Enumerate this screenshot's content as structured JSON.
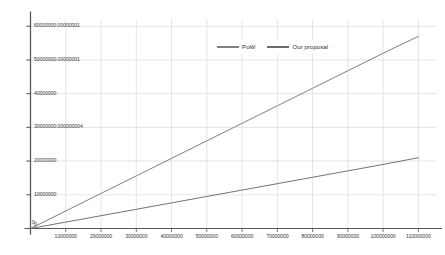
{
  "chart_data": {
    "type": "line",
    "title": "",
    "subtitle": "",
    "xlabel": "",
    "ylabel": "",
    "grid": true,
    "legend_position": "top-center",
    "xlim": [
      0,
      115000000
    ],
    "ylim": [
      0,
      62000000
    ],
    "x_ticks": [
      0,
      10000000,
      20000000,
      30000000,
      40000000,
      50000000,
      60000000,
      70000000,
      80000000,
      90000000,
      100000000,
      110000000
    ],
    "x_tick_labels": [
      "0",
      "10000000",
      "20000000",
      "30000000",
      "40000000",
      "50000000",
      "60000000",
      "70000000",
      "80000000",
      "90000000",
      "100000000",
      "110000000"
    ],
    "y_ticks": [
      0,
      10000000,
      20000000,
      30000000,
      40000000,
      50000000,
      60000000
    ],
    "y_tick_labels": [
      "0",
      "10000000",
      "20000000",
      "30000000.000000004",
      "40000000",
      "50000000.00000001",
      "60000000.00000001"
    ],
    "series": [
      {
        "name": "PoW",
        "color": "#808080",
        "x": [
          0,
          10000000,
          20000000,
          30000000,
          40000000,
          50000000,
          60000000,
          70000000,
          80000000,
          90000000,
          100000000,
          110000000
        ],
        "values": [
          0,
          5200000,
          10400000,
          15600000,
          20800000,
          26000000,
          31200000,
          36400000,
          41600000,
          46800000,
          52000000,
          57000000
        ]
      },
      {
        "name": "Our proposal",
        "color": "#737373",
        "x": [
          0,
          10000000,
          20000000,
          30000000,
          40000000,
          50000000,
          60000000,
          70000000,
          80000000,
          90000000,
          100000000,
          110000000
        ],
        "values": [
          0,
          1900000,
          3800000,
          5700000,
          7600000,
          9500000,
          11400000,
          13300000,
          15200000,
          17100000,
          19000000,
          21000000
        ]
      }
    ]
  },
  "legend": {
    "items": [
      {
        "label": "PoW",
        "color": "#808080"
      },
      {
        "label": "Our proposal",
        "color": "#6b6b6b"
      }
    ]
  },
  "axes": {
    "axis_color": "#595959",
    "grid_color": "#d9d9d9",
    "tick_text_color": "#3a3a3a"
  }
}
